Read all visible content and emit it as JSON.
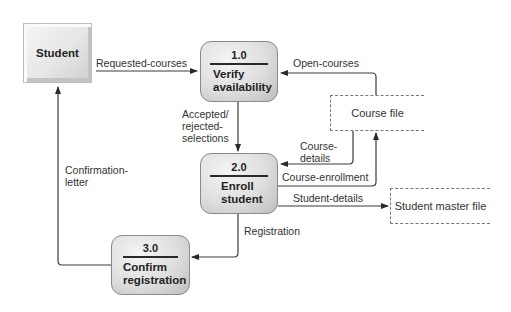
{
  "diagram": {
    "type": "data-flow-diagram",
    "external_entities": [
      {
        "id": "student",
        "label": "Student"
      }
    ],
    "processes": [
      {
        "id": "p1",
        "number": "1.0",
        "name_line1": "Verify",
        "name_line2": "availability"
      },
      {
        "id": "p2",
        "number": "2.0",
        "name_line1": "Enroll",
        "name_line2": "student"
      },
      {
        "id": "p3",
        "number": "3.0",
        "name_line1": "Confirm",
        "name_line2": "registration"
      }
    ],
    "data_stores": [
      {
        "id": "course_file",
        "label": "Course file"
      },
      {
        "id": "student_master_file",
        "label": "Student master file"
      }
    ],
    "flows": [
      {
        "from": "student",
        "to": "p1",
        "label": "Requested-courses"
      },
      {
        "from": "course_file",
        "to": "p1",
        "label": "Open-courses"
      },
      {
        "from": "p1",
        "to": "p2",
        "label_lines": [
          "Accepted/",
          "rejected-",
          "selections"
        ]
      },
      {
        "from": "course_file",
        "to": "p2",
        "label_lines": [
          "Course-",
          "details"
        ]
      },
      {
        "from": "p2",
        "to": "course_file",
        "label": "Course-enrollment"
      },
      {
        "from": "p2",
        "to": "student_master_file",
        "label": "Student-details"
      },
      {
        "from": "p2",
        "to": "p3",
        "label": "Registration"
      },
      {
        "from": "p3",
        "to": "student",
        "label_lines": [
          "Confirmation-",
          "letter"
        ]
      }
    ]
  }
}
